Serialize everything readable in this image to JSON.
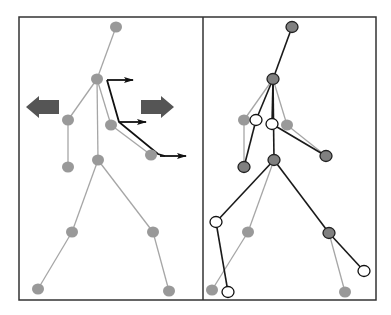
{
  "figure": {
    "width": 391,
    "height": 315,
    "frame": {
      "x": 19,
      "y": 17,
      "width": 357,
      "height": 283,
      "divider_x": 203,
      "stroke": "#333333"
    },
    "colors": {
      "gray_line": "#a6a6a6",
      "gray_node": "#999999",
      "dark_line": "#1a1a1a",
      "dark_node": "#808080",
      "white_node": "#ffffff",
      "arrow_block": "#555555",
      "arrow_black": "#111111"
    }
  },
  "left_panel": {
    "name": "reference-skeleton",
    "nodes": [
      {
        "id": "head",
        "x": 116,
        "y": 27
      },
      {
        "id": "neck",
        "x": 97,
        "y": 79
      },
      {
        "id": "l_shoulder",
        "x": 68,
        "y": 120
      },
      {
        "id": "l_hand",
        "x": 68,
        "y": 167
      },
      {
        "id": "r_elbow",
        "x": 111,
        "y": 125
      },
      {
        "id": "r_hand",
        "x": 151,
        "y": 155
      },
      {
        "id": "hip",
        "x": 98,
        "y": 160
      },
      {
        "id": "l_knee",
        "x": 72,
        "y": 232
      },
      {
        "id": "l_foot",
        "x": 38,
        "y": 289
      },
      {
        "id": "r_knee",
        "x": 153,
        "y": 232
      },
      {
        "id": "r_foot",
        "x": 169,
        "y": 291
      }
    ],
    "edges": [
      [
        "head",
        "neck"
      ],
      [
        "neck",
        "l_shoulder"
      ],
      [
        "l_shoulder",
        "l_hand"
      ],
      [
        "neck",
        "r_elbow"
      ],
      [
        "r_elbow",
        "r_hand"
      ],
      [
        "neck",
        "hip"
      ],
      [
        "hip",
        "l_knee"
      ],
      [
        "l_knee",
        "l_foot"
      ],
      [
        "hip",
        "r_knee"
      ],
      [
        "r_knee",
        "r_foot"
      ]
    ],
    "block_arrows": [
      {
        "id": "left-arrow",
        "direction": "left",
        "x": 26,
        "y": 96,
        "w": 33,
        "h": 22
      },
      {
        "id": "right-arrow",
        "direction": "right",
        "x": 141,
        "y": 96,
        "w": 33,
        "h": 22
      }
    ],
    "motion_path": {
      "points": [
        [
          107,
          80
        ],
        [
          119,
          122
        ],
        [
          158,
          154
        ],
        [
          165,
          156
        ]
      ],
      "arrows": [
        {
          "from": [
            107,
            80
          ],
          "to": [
            133,
            80
          ]
        },
        {
          "from": [
            119,
            122
          ],
          "to": [
            146,
            122
          ]
        },
        {
          "from": [
            160,
            156
          ],
          "to": [
            186,
            156
          ]
        }
      ]
    }
  },
  "right_panel": {
    "name": "deformed-skeleton",
    "gray_nodes": [
      {
        "id": "g_l_shoulder",
        "x": 244,
        "y": 120
      },
      {
        "id": "g_r_elbow",
        "x": 287,
        "y": 125
      },
      {
        "id": "g_l_knee",
        "x": 248,
        "y": 232
      },
      {
        "id": "g_l_foot",
        "x": 212,
        "y": 290
      },
      {
        "id": "g_r_foot",
        "x": 345,
        "y": 292
      }
    ],
    "gray_edges": [
      [
        [
          273,
          79
        ],
        [
          244,
          120
        ]
      ],
      [
        [
          244,
          120
        ],
        [
          244,
          167
        ]
      ],
      [
        [
          273,
          79
        ],
        [
          287,
          125
        ]
      ],
      [
        [
          287,
          125
        ],
        [
          326,
          156
        ]
      ],
      [
        [
          274,
          160
        ],
        [
          248,
          232
        ]
      ],
      [
        [
          248,
          232
        ],
        [
          212,
          290
        ]
      ],
      [
        [
          329,
          233
        ],
        [
          345,
          292
        ]
      ]
    ],
    "dark_nodes": [
      {
        "id": "head",
        "x": 292,
        "y": 27
      },
      {
        "id": "neck",
        "x": 273,
        "y": 79
      },
      {
        "id": "l_hand",
        "x": 244,
        "y": 167
      },
      {
        "id": "r_hand",
        "x": 326,
        "y": 156
      },
      {
        "id": "hip",
        "x": 274,
        "y": 160
      },
      {
        "id": "r_knee",
        "x": 329,
        "y": 233
      }
    ],
    "white_nodes": [
      {
        "id": "w_l_shoulder",
        "x": 256,
        "y": 120
      },
      {
        "id": "w_r_elbow",
        "x": 272,
        "y": 124
      },
      {
        "id": "w_l_knee",
        "x": 216,
        "y": 222
      },
      {
        "id": "w_l_foot",
        "x": 228,
        "y": 292
      },
      {
        "id": "w_r_foot",
        "x": 364,
        "y": 271
      }
    ],
    "dark_edges": [
      [
        [
          292,
          27
        ],
        [
          273,
          79
        ]
      ],
      [
        [
          273,
          79
        ],
        [
          256,
          120
        ]
      ],
      [
        [
          256,
          120
        ],
        [
          244,
          167
        ]
      ],
      [
        [
          273,
          79
        ],
        [
          272,
          124
        ]
      ],
      [
        [
          272,
          124
        ],
        [
          326,
          156
        ]
      ],
      [
        [
          273,
          79
        ],
        [
          274,
          160
        ]
      ],
      [
        [
          274,
          160
        ],
        [
          216,
          222
        ]
      ],
      [
        [
          216,
          222
        ],
        [
          228,
          292
        ]
      ],
      [
        [
          274,
          160
        ],
        [
          329,
          233
        ]
      ],
      [
        [
          329,
          233
        ],
        [
          364,
          271
        ]
      ]
    ]
  }
}
